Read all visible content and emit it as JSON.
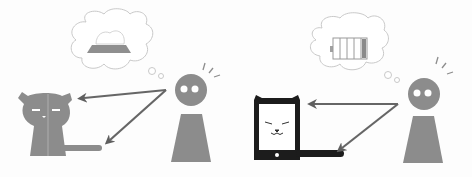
{
  "figure": {
    "colors": {
      "background": "#fdfdfd",
      "figure_gray": "#8c8c8c",
      "arrow_gray": "#6a6a6a",
      "cloud_stroke": "#c8c8c8",
      "device_black": "#1a1a1a"
    },
    "panels": [
      {
        "id": "left",
        "subject": "cat",
        "thought": "food-bowl-icon",
        "person": "person-icon",
        "arrows": 2
      },
      {
        "id": "right",
        "subject": "cat-shaped-tablet",
        "thought": "battery-icon",
        "person": "person-icon",
        "arrows": 2
      }
    ]
  }
}
